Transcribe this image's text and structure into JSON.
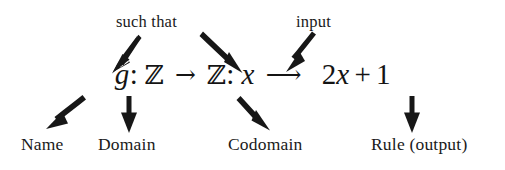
{
  "figure": {
    "background_color": "#ffffff",
    "ink_color": "#171717"
  },
  "formula": {
    "full_text": "g: Z -> Z: x -> 2x + 1",
    "function_name": "g",
    "colon_1": ":",
    "domain_symbol": "ℤ",
    "map_arrow_1": "→",
    "codomain_symbol": "ℤ",
    "colon_2": ":",
    "input_variable": "x",
    "map_arrow_2": "⟶",
    "rule_coefficient": "2",
    "rule_variable": "x",
    "rule_operator": "+",
    "rule_constant": "1"
  },
  "top_annotations": [
    {
      "id": "such-that",
      "label": "such that",
      "arrow_count": 2,
      "points_to": [
        "colon-after-g",
        "codomain-Z"
      ]
    },
    {
      "id": "input",
      "label": "input",
      "arrow_count": 1,
      "points_to": [
        "input-variable-x"
      ]
    }
  ],
  "bottom_annotations": [
    {
      "id": "name",
      "label": "Name",
      "points_to": "function-name-g"
    },
    {
      "id": "domain",
      "label": "Domain",
      "points_to": "domain-Z"
    },
    {
      "id": "codomain",
      "label": "Codomain",
      "points_to": "codomain-Z"
    },
    {
      "id": "rule",
      "label": "Rule (output)",
      "points_to": "rule-2x-plus-1"
    }
  ],
  "arrows": {
    "such_that_left": {
      "name": "arrow-such-that-to-g",
      "direction": "down-left"
    },
    "such_that_right": {
      "name": "arrow-such-that-to-codomain",
      "direction": "down-right"
    },
    "input": {
      "name": "arrow-input-to-x",
      "direction": "down-left"
    },
    "name": {
      "name": "arrow-g-to-name",
      "direction": "down-left"
    },
    "domain": {
      "name": "arrow-to-domain",
      "direction": "down"
    },
    "codomain": {
      "name": "arrow-to-codomain",
      "direction": "down-right"
    },
    "rule": {
      "name": "arrow-to-rule",
      "direction": "down"
    }
  }
}
